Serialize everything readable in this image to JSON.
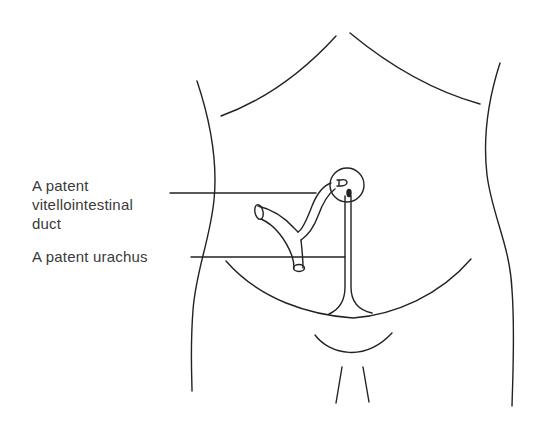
{
  "figure": {
    "labels": [
      {
        "id": "vitellointestinal",
        "lines": [
          "A patent",
          "vitellointestinal",
          "duct"
        ]
      },
      {
        "id": "urachus",
        "lines": [
          "A patent urachus"
        ]
      }
    ],
    "colors": {
      "line": "#222222",
      "text": "#3a3a3a",
      "background": "#ffffff"
    }
  }
}
